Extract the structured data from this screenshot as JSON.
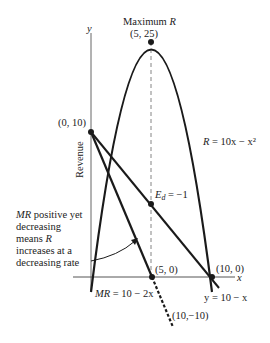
{
  "diagram": {
    "axis_labels": {
      "y": "y",
      "x": "x",
      "revenue": "Revenue"
    },
    "max_label": {
      "line1": "Maximum R",
      "line1_plain": "Maximum ",
      "line1_var": "R",
      "line2": "(5, 25)"
    },
    "points": {
      "intercept": "(0, 10)",
      "mr_zero": "(5, 0)",
      "r_zero": "(10, 0)",
      "mr_end": "(10,−10)"
    },
    "equations": {
      "revenue": {
        "lhs": "R",
        "rhs": " =  10x − x²"
      },
      "marginal_revenue": {
        "lhs": "MR",
        "rhs": " = 10 − 2x"
      },
      "demand": {
        "text": "y = 10 − x"
      },
      "elasticity": {
        "sym": "E",
        "sub": "d",
        "rhs": " = −1"
      }
    },
    "annotation": {
      "lines": [
        {
          "var": "MR",
          "text": " positive yet"
        },
        {
          "var": "",
          "text": "decreasing"
        },
        {
          "var": "",
          "text": "means ",
          "tail_var": "R"
        },
        {
          "var": "",
          "text": "increases  at a"
        },
        {
          "var": "",
          "text": "decreasing rate"
        }
      ]
    },
    "colors": {
      "ink": "#1a1a1a",
      "axis": "#555555",
      "dashed": "#777777"
    }
  }
}
